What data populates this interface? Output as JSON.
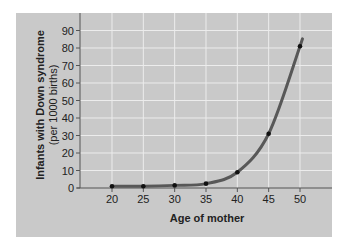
{
  "chart_data": {
    "type": "line",
    "title": "",
    "xlabel": "Age of mother",
    "ylabel": "Infants with Down syndrome",
    "ylabel_sub": "(per 1000 births)",
    "x": [
      20,
      25,
      30,
      35,
      40,
      45,
      50
    ],
    "series": [
      {
        "name": "Infants with Down syndrome per 1000 births",
        "values": [
          1,
          1,
          1.5,
          2.5,
          9,
          31,
          81
        ]
      }
    ],
    "xticks": [
      20,
      25,
      30,
      35,
      40,
      45,
      50
    ],
    "yticks": [
      0,
      10,
      20,
      30,
      40,
      50,
      60,
      70,
      80,
      90
    ],
    "xlim": [
      15,
      55
    ],
    "ylim": [
      0,
      95
    ],
    "grid": true,
    "legend": null
  },
  "colors": {
    "panel": "#c9c9c9",
    "grid": "#ececec",
    "curve": "#585858",
    "points": "#111111",
    "axis": "#555555"
  }
}
